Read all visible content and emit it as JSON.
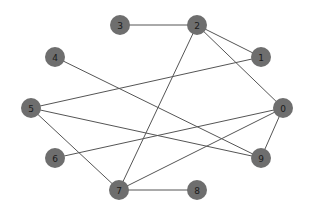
{
  "graph": {
    "node_color": "#6e6e6e",
    "edge_color": "#555555",
    "label_color": "#1a1a1a",
    "node_radius": 10,
    "nodes": [
      {
        "id": "0",
        "label": "0",
        "x": 283,
        "y": 108
      },
      {
        "id": "1",
        "label": "1",
        "x": 261,
        "y": 57
      },
      {
        "id": "2",
        "label": "2",
        "x": 197,
        "y": 25
      },
      {
        "id": "3",
        "label": "3",
        "x": 120,
        "y": 25
      },
      {
        "id": "4",
        "label": "4",
        "x": 55,
        "y": 57
      },
      {
        "id": "5",
        "label": "5",
        "x": 31,
        "y": 108
      },
      {
        "id": "6",
        "label": "6",
        "x": 55,
        "y": 158
      },
      {
        "id": "7",
        "label": "7",
        "x": 119,
        "y": 190
      },
      {
        "id": "8",
        "label": "8",
        "x": 197,
        "y": 190
      },
      {
        "id": "9",
        "label": "9",
        "x": 261,
        "y": 158
      }
    ],
    "edges": [
      [
        "3",
        "2"
      ],
      [
        "2",
        "1"
      ],
      [
        "2",
        "0"
      ],
      [
        "2",
        "7"
      ],
      [
        "4",
        "9"
      ],
      [
        "5",
        "1"
      ],
      [
        "5",
        "9"
      ],
      [
        "5",
        "7"
      ],
      [
        "6",
        "0"
      ],
      [
        "7",
        "0"
      ],
      [
        "7",
        "8"
      ],
      [
        "0",
        "9"
      ]
    ]
  }
}
